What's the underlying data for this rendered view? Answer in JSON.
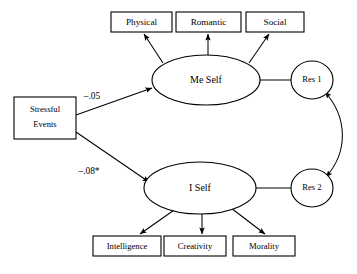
{
  "diagram": {
    "type": "structural-equation-model",
    "title": "",
    "background_color": "#ffffff",
    "stroke_color": "#000000",
    "predictor": {
      "name": "stressful-events",
      "shape": "rectangle",
      "label_line1": "Stressful",
      "label_line2": "Events"
    },
    "latent_factors": [
      {
        "name": "me-self",
        "shape": "ellipse",
        "label": "Me Self"
      },
      {
        "name": "i-self",
        "shape": "ellipse",
        "label": "I Self"
      }
    ],
    "indicators_top": [
      {
        "name": "physical",
        "label": "Physical"
      },
      {
        "name": "romantic",
        "label": "Romantic"
      },
      {
        "name": "social",
        "label": "Social"
      }
    ],
    "indicators_bottom": [
      {
        "name": "intelligence",
        "label": "Intelligence"
      },
      {
        "name": "creativity",
        "label": "Creativity"
      },
      {
        "name": "morality",
        "label": "Morality"
      }
    ],
    "residuals": [
      {
        "name": "res-1",
        "shape": "circle",
        "label": "Res 1"
      },
      {
        "name": "res-2",
        "shape": "circle",
        "label": "Res 2"
      }
    ],
    "path_coefficients": [
      {
        "name": "stressful-to-me-self",
        "label": "–.05",
        "from": "Stressful Events",
        "to": "Me Self",
        "significant": false
      },
      {
        "name": "stressful-to-i-self",
        "label": "–.08*",
        "from": "Stressful Events",
        "to": "I Self",
        "significant": true
      }
    ],
    "correlation": {
      "name": "res1-res2-correlation",
      "from": "Res 1",
      "to": "Res 2",
      "label": "",
      "double_headed": true
    }
  }
}
